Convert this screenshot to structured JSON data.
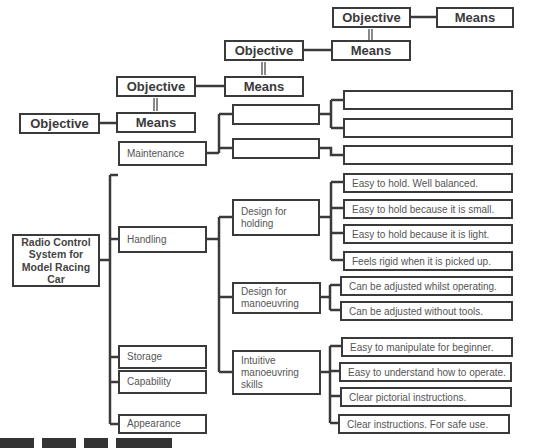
{
  "diagram": {
    "legend_chain": [
      {
        "objective": "Objective",
        "means": "Means"
      },
      {
        "objective": "Objective",
        "means": "Means"
      },
      {
        "objective": "Objective",
        "means": "Means"
      },
      {
        "objective": "Objective",
        "means": "Means"
      }
    ],
    "empty_boxes": {
      "middle": [
        "",
        ""
      ],
      "right": [
        "",
        "",
        ""
      ]
    },
    "root": "Radio Control System for Model Racing Car",
    "categories": [
      {
        "label": "Maintenance"
      },
      {
        "label": "Handling"
      },
      {
        "label": "Storage"
      },
      {
        "label": "Capability"
      },
      {
        "label": "Appearance"
      }
    ],
    "handling_subgroups": [
      {
        "label": "Design for holding",
        "items": [
          "Easy to hold. Well balanced.",
          "Easy to hold because it is small.",
          "Easy to hold because it is light.",
          "Feels rigid when it is picked up."
        ]
      },
      {
        "label": "Design for manoeuvring",
        "items": [
          "Can be adjusted whilst operating.",
          "Can be adjusted without tools."
        ]
      },
      {
        "label": "Intuitive manoeuvring skills",
        "items": [
          "Easy to manipulate for beginner.",
          "Easy to understand how to operate.",
          "Clear pictorial instructions.",
          "Clear instructions. For safe use."
        ]
      }
    ],
    "colors": {
      "line": "#3a3a3a",
      "text": "#555555",
      "background": "#ffffff"
    }
  }
}
